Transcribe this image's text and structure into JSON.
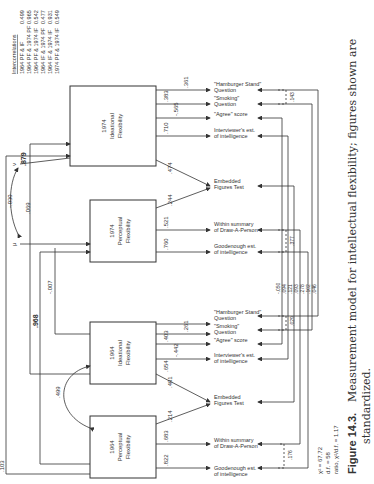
{
  "figure": {
    "caption_label": "Figure 14.3.",
    "caption_text": "Measurement model for intellectual flexibility; figures shown are",
    "caption_text_2": "standardized."
  },
  "fit": {
    "chi2": "χ² = 67.72",
    "df": "d.f. = 58",
    "ratio": "ratio, χ²/d.f. = 1.17"
  },
  "intercorrelations": {
    "title": "Intercorrelations",
    "rows": [
      {
        "pair": "1964 PF & IF",
        "value": "0.499"
      },
      {
        "pair": "1964 PF & 1974 PF",
        "value": "0.965"
      },
      {
        "pair": "1964 PF & 1974 IF",
        "value": "0.542"
      },
      {
        "pair": "1964 IF & 1974 PF",
        "value": "0.477"
      },
      {
        "pair": "1964 IF & 1974 IF",
        "value": "0.931"
      },
      {
        "pair": "1974 PF & 1974 IF",
        "value": "0.549"
      }
    ]
  },
  "factors": [
    {
      "year": "1964",
      "l1": "Perceptual",
      "l2": "Flexibility"
    },
    {
      "year": "1964",
      "l1": "Ideational",
      "l2": "Flexibility"
    },
    {
      "year": "1974",
      "l1": "Perceptual",
      "l2": "Flexibility"
    },
    {
      "year": "1974",
      "l1": "Ideational",
      "l2": "Flexibility"
    }
  ],
  "indicators": [
    {
      "l1": "Goodenough est.",
      "l2": "of intelligence",
      "loading": ".822"
    },
    {
      "l1": "Within summary",
      "l2": "of Draw-A-Person",
      "loading": ".683"
    },
    {
      "l1": "Embedded",
      "l2": "Figures Test",
      "loading_a": ".214",
      "loading_b": ".401"
    },
    {
      "l1": "Interviewer's est.",
      "l2": "of intelligence",
      "loading": ".654"
    },
    {
      "l1": "\"Agree\" score",
      "l2": "",
      "loading": "-.442"
    },
    {
      "l1": "\"Smoking\"",
      "l2": "Question",
      "loading": ".403"
    },
    {
      "l1": "\"Hamburger Stand\"",
      "l2": "Question",
      "loading": ".261"
    },
    {
      "l1": "Goodenough est.",
      "l2": "of intelligence",
      "loading": ".760"
    },
    {
      "l1": "Within summary",
      "l2": "of Draw-A-Person",
      "loading": ".521"
    },
    {
      "l1": "Embedded",
      "l2": "Figures Test",
      "loading_a": ".244",
      "loading_b": ".474"
    },
    {
      "l1": "Interviewer's est.",
      "l2": "of intelligence",
      "loading": ".710"
    },
    {
      "l1": "\"Agree\" score",
      "l2": "",
      "loading": "-.565"
    },
    {
      "l1": "\"Smoking\"",
      "l2": "Question",
      "loading": ".383"
    },
    {
      "l1": "\"Hamburger Stand\"",
      "l2": "Question",
      "loading": ".361"
    }
  ],
  "paths": {
    "pf64_if64": ".499",
    "pf64_pf74": ".968",
    "if64_pf74": "-.007",
    "mu_pf74": ".069",
    "nu_if74": ".879",
    "mu_nu": "-.030",
    "pf64_if74": ".103",
    "mu": "μ",
    "nu": "ν"
  },
  "error_correlations": {
    "e1": ".176",
    "e2": ".029",
    "e3": ".377",
    "e4": ".143",
    "stack": [
      "-.050",
      ".094",
      ".121",
      ".093",
      ".278",
      ".102",
      ".046"
    ]
  }
}
